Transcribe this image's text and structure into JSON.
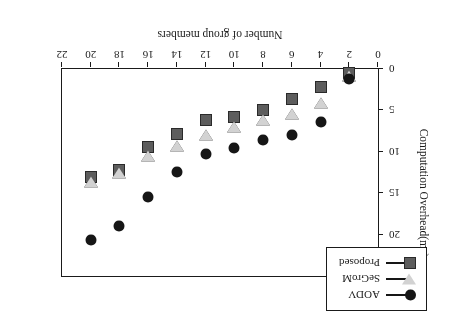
{
  "chart_data": {
    "type": "scatter",
    "title": "",
    "xlabel": "Number of group members",
    "ylabel": "Computation Overhead(ms)",
    "x": [
      2,
      4,
      6,
      8,
      10,
      12,
      14,
      16,
      18,
      20
    ],
    "xlim": [
      0,
      22
    ],
    "ylim": [
      0,
      25
    ],
    "xticks": [
      "0",
      "2",
      "4",
      "6",
      "8",
      "10",
      "12",
      "14",
      "16",
      "18",
      "20",
      "22"
    ],
    "xtick_values": [
      0,
      2,
      4,
      6,
      8,
      10,
      12,
      14,
      16,
      18,
      20,
      22
    ],
    "yticks": [
      "0",
      "5",
      "10",
      "15",
      "20",
      "25"
    ],
    "ytick_values": [
      0,
      5,
      10,
      15,
      20,
      25
    ],
    "grid": false,
    "legend_position": "top-left",
    "rotated_180": true,
    "series": [
      {
        "name": "AODV",
        "marker": "circle",
        "color": "#161616",
        "values": [
          1.2,
          6.4,
          8.0,
          8.6,
          9.5,
          10.3,
          12.5,
          15.4,
          19.0,
          20.6
        ]
      },
      {
        "name": "SeGroM",
        "marker": "triangle-down",
        "color": "#d2d2d2",
        "values": [
          0.8,
          4.1,
          5.4,
          6.1,
          7.0,
          8.0,
          9.3,
          10.5,
          12.6,
          13.6
        ]
      },
      {
        "name": "Proposed",
        "marker": "square",
        "color": "#5d5d5d",
        "values": [
          0.5,
          2.2,
          3.6,
          5.0,
          5.8,
          6.2,
          7.9,
          9.4,
          12.2,
          13.0
        ]
      }
    ]
  }
}
